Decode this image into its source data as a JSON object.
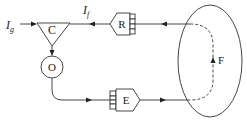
{
  "diagram": {
    "type": "block-diagram",
    "nodes": {
      "comparator": {
        "label": "C",
        "shape": "triangle"
      },
      "oscillator": {
        "label": "O",
        "shape": "circle"
      },
      "receiver": {
        "label": "R",
        "shape": "hexagon-with-comb"
      },
      "emitter": {
        "label": "E",
        "shape": "hexagon-with-comb"
      },
      "field_loop": {
        "label": "F",
        "shape": "ellipse"
      }
    },
    "signals": {
      "input": {
        "label_main": "I",
        "label_sub": "g"
      },
      "feedback": {
        "label_main": "I",
        "label_sub": "f"
      }
    },
    "edges": [
      {
        "from": "input",
        "to": "comparator"
      },
      {
        "from": "comparator",
        "to": "oscillator"
      },
      {
        "from": "oscillator",
        "to": "emitter"
      },
      {
        "from": "emitter",
        "to": "field_loop"
      },
      {
        "from": "field_loop",
        "to": "receiver",
        "style": "dashed-inside-loop"
      },
      {
        "from": "receiver",
        "to": "comparator",
        "signal": "feedback"
      }
    ],
    "colors": {
      "line": "#333333",
      "background": "#ffffff"
    }
  }
}
